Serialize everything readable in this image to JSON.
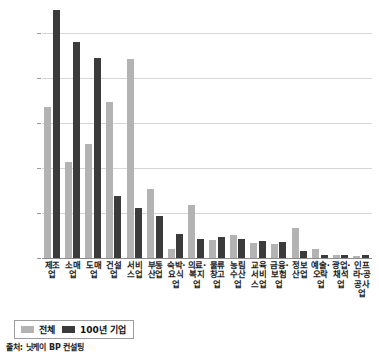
{
  "chart_data": {
    "type": "bar",
    "title": "",
    "xlabel": "",
    "ylabel": "",
    "ylim": [
      0,
      27.5
    ],
    "yticks": [
      "0.0%",
      "5.0%",
      "10.0%",
      "15.0%",
      "20.0%",
      "25.0%"
    ],
    "ytick_values": [
      0,
      5,
      10,
      15,
      20,
      25
    ],
    "grid": true,
    "legend_position": "bottom-left",
    "categories": [
      "제조업",
      "소매업",
      "도매업",
      "건설업",
      "서비스업",
      "부동산업",
      "숙박·요식업",
      "의료·복지업",
      "물류창고업",
      "농림수산업",
      "교육 서비스업",
      "금융·보험업",
      "정보산업",
      "예술·오락업",
      "광업·채석업",
      "인프라·공공사업"
    ],
    "series": [
      {
        "name": "전체",
        "color": "#b3b3b3",
        "values": [
          16.7,
          10.6,
          12.6,
          17.3,
          22.1,
          7.6,
          1.0,
          5.9,
          2.0,
          2.6,
          1.7,
          1.5,
          3.3,
          1.0,
          0.3,
          0.2
        ]
      },
      {
        "name": "100년 기업",
        "color": "#3b3b3b",
        "values": [
          27.5,
          23.9,
          22.2,
          6.9,
          5.6,
          4.7,
          2.7,
          2.1,
          2.3,
          2.1,
          1.9,
          1.8,
          0.8,
          0.3,
          0.3,
          0.3
        ]
      }
    ],
    "source": "출처: 닛케이 BP 컨설팅"
  },
  "legend": {
    "items": [
      {
        "label": "전체",
        "swatch": "total-swatch"
      },
      {
        "label": "100년 기업",
        "swatch": "century-swatch"
      }
    ]
  },
  "footer": {
    "source_text": "출처: 닛케이 BP 컨설팅"
  }
}
